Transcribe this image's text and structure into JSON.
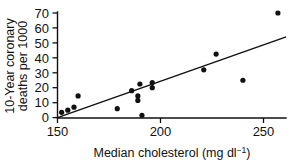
{
  "chart_data": {
    "type": "scatter",
    "title": "",
    "xlabel": "Median cholesterol (mg dl⁻¹)",
    "xlabel_main": "Median cholesterol (mg dl",
    "xlabel_sup": "−1",
    "xlabel_tail": ")",
    "ylabel": "10-Year coronary deaths per 1000",
    "ylabel_line1": "10-Year coronary",
    "ylabel_line2": "deaths per 1000",
    "xlim": [
      150,
      262
    ],
    "ylim": [
      0,
      73
    ],
    "xticks": [
      150,
      200,
      250
    ],
    "yticks": [
      0,
      10,
      20,
      30,
      40,
      50,
      60,
      70
    ],
    "xtick_labels": [
      "150",
      "200",
      "250"
    ],
    "ytick_labels": [
      "0",
      "10",
      "20",
      "30",
      "40",
      "50",
      "60",
      "70"
    ],
    "grid": false,
    "legend": false,
    "point_color": "#111111",
    "line_color": "#111111",
    "points": [
      {
        "x": 152,
        "y": 3.5
      },
      {
        "x": 155,
        "y": 5
      },
      {
        "x": 158,
        "y": 7
      },
      {
        "x": 160,
        "y": 14.5
      },
      {
        "x": 179,
        "y": 6
      },
      {
        "x": 186,
        "y": 18
      },
      {
        "x": 189,
        "y": 14.5
      },
      {
        "x": 189,
        "y": 11.5
      },
      {
        "x": 190,
        "y": 22.5
      },
      {
        "x": 191,
        "y": 1.5
      },
      {
        "x": 196,
        "y": 23.5
      },
      {
        "x": 196,
        "y": 20
      },
      {
        "x": 221,
        "y": 32
      },
      {
        "x": 227,
        "y": 42.5
      },
      {
        "x": 240,
        "y": 25
      },
      {
        "x": 257,
        "y": 70
      }
    ],
    "fit_line": {
      "x0": 150,
      "y0": 0,
      "x1": 261,
      "y1": 54
    },
    "point_radius": 2.6
  }
}
